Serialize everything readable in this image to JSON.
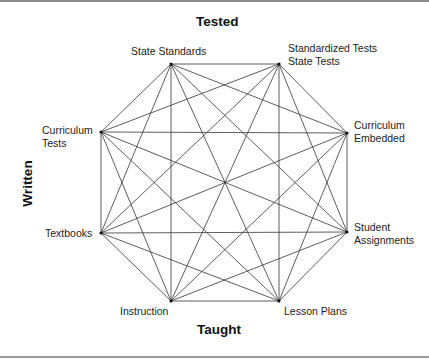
{
  "axes": {
    "top": "Tested",
    "bottom": "Taught",
    "left": "Written"
  },
  "nodes": [
    {
      "id": "state-standards",
      "lines": [
        "State Standards"
      ],
      "x": 171,
      "y": 64
    },
    {
      "id": "standardized-tests",
      "lines": [
        "Standardized Tests",
        "State Tests"
      ],
      "x": 279,
      "y": 64
    },
    {
      "id": "curriculum-embedded",
      "lines": [
        "Curriculum",
        "Embedded"
      ],
      "x": 347,
      "y": 133
    },
    {
      "id": "student-assignments",
      "lines": [
        "Student",
        "Assignments"
      ],
      "x": 347,
      "y": 232
    },
    {
      "id": "lesson-plans",
      "lines": [
        "Lesson Plans"
      ],
      "x": 279,
      "y": 301
    },
    {
      "id": "instruction",
      "lines": [
        "Instruction"
      ],
      "x": 171,
      "y": 301
    },
    {
      "id": "textbooks",
      "lines": [
        "Textbooks"
      ],
      "x": 101,
      "y": 233
    },
    {
      "id": "curriculum-tests",
      "lines": [
        "Curriculum",
        "Tests"
      ],
      "x": 101,
      "y": 132
    }
  ],
  "labels": {
    "state_standards": "State Standards",
    "standardized_tests_1": "Standardized Tests",
    "standardized_tests_2": "State Tests",
    "curriculum_embedded_1": "Curriculum",
    "curriculum_embedded_2": "Embedded",
    "student_assignments_1": "Student",
    "student_assignments_2": "Assignments",
    "lesson_plans": "Lesson Plans",
    "instruction": "Instruction",
    "textbooks": "Textbooks",
    "curriculum_tests_1": "Curriculum",
    "curriculum_tests_2": "Tests"
  },
  "edges": "complete-graph (every node connected to every other node)",
  "colors": {
    "line": "#333333",
    "node": "#111111",
    "text": "#222222",
    "rule": "#8c8c8c"
  }
}
